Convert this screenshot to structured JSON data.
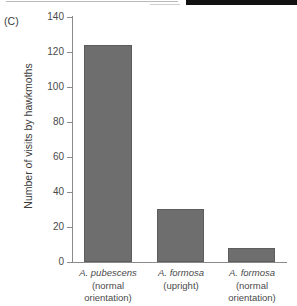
{
  "panel": {
    "letter": "(C)"
  },
  "chart_data": {
    "type": "bar",
    "title": "",
    "subtitle": "",
    "xlabel": "",
    "ylabel": "Number of visits by hawkmoths",
    "ylim": [
      0,
      140
    ],
    "yticks": [
      0,
      20,
      40,
      60,
      80,
      100,
      120,
      140
    ],
    "ytick_labels": [
      "0",
      "20",
      "40",
      "60",
      "80",
      "100",
      "120",
      "140"
    ],
    "grid": false,
    "legend": null,
    "bar_color": "#6e6e6e",
    "bar_edge_color": "#5d5d5d",
    "axis_color": "#8a8a8a",
    "categories": [
      "A. pubescens (normal orientation)",
      "A. formosa (upright)",
      "A. formosa (normal orientation)"
    ],
    "values": [
      124,
      30,
      8
    ],
    "bars": [
      {
        "species": "A. pubescens",
        "condition_lines": [
          "(normal",
          "orientation)"
        ],
        "value": 124
      },
      {
        "species": "A. formosa",
        "condition_lines": [
          "(upright)"
        ],
        "value": 30
      },
      {
        "species": "A. formosa",
        "condition_lines": [
          "(normal",
          "orientation)"
        ],
        "value": 8
      }
    ]
  }
}
